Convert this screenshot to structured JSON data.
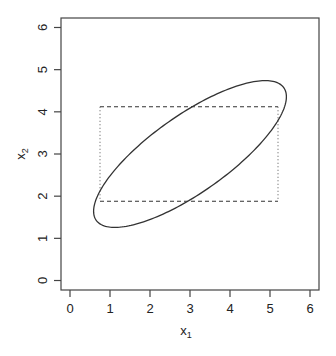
{
  "chart_data": {
    "type": "scatter",
    "title": "",
    "xlabel": "x",
    "xlabel_subscript": "1",
    "ylabel": "x",
    "ylabel_subscript": "2",
    "xlim": [
      -0.225,
      6.225
    ],
    "ylim": [
      -0.225,
      6.225
    ],
    "xticks": [
      0,
      1,
      2,
      3,
      4,
      5,
      6
    ],
    "yticks": [
      0,
      1,
      2,
      3,
      4,
      5,
      6
    ],
    "grid": false,
    "legend": null,
    "shapes": [
      {
        "name": "ellipse",
        "kind": "ellipse",
        "line_style": "solid",
        "center": [
          3.0,
          3.0
        ],
        "x_half_extent": 2.41,
        "y_half_extent": 1.74,
        "correlation": 0.78,
        "x_range": [
          0.58,
          5.42
        ],
        "y_range": [
          1.26,
          4.74
        ]
      },
      {
        "name": "rectangle",
        "kind": "rectangle",
        "horizontal_edges_style": "dashed",
        "vertical_edges_style": "dotted",
        "x": [
          0.75,
          5.2
        ],
        "y": [
          1.88,
          4.12
        ]
      }
    ]
  },
  "colors": {
    "axis": "#444444",
    "line": "#333333",
    "background": "#ffffff"
  }
}
